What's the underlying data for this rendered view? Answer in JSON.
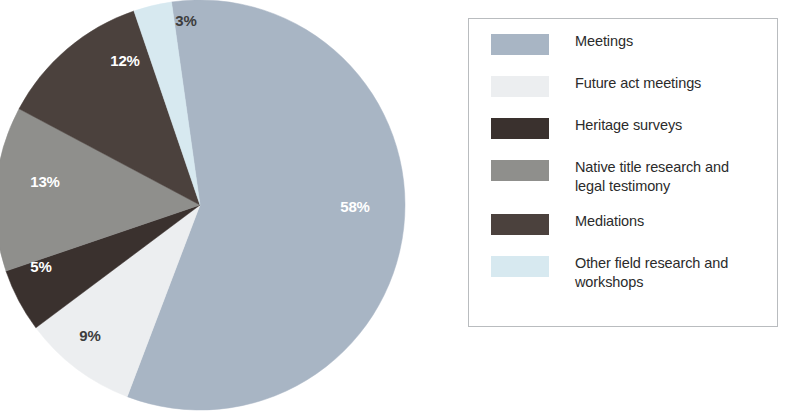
{
  "chart_data": {
    "type": "pie",
    "title": "",
    "subtitle": "",
    "xlabel": "",
    "ylabel": "",
    "grid": false,
    "legend_position": "right",
    "unit": "%",
    "start_angle_deg": -8,
    "direction": "clockwise",
    "categories": [
      "Meetings",
      "Future act meetings",
      "Heritage surveys",
      "Native title research and legal testimony",
      "Mediations",
      "Other field research and workshops"
    ],
    "values": [
      58,
      9,
      5,
      13,
      12,
      3
    ],
    "value_labels": [
      "58%",
      "9%",
      "5%",
      "13%",
      "12%",
      "3%"
    ],
    "colors": [
      "#a8b5c4",
      "#eceef0",
      "#3a312e",
      "#8f8f8c",
      "#4b413d",
      "#d7e9f0"
    ],
    "label_colors": [
      "#ffffff",
      "#3d3d3d",
      "#ffffff",
      "#ffffff",
      "#ffffff",
      "#3d3d3d"
    ],
    "slices": [
      {
        "label": "Meetings",
        "value": 58,
        "value_label": "58%",
        "color": "#a8b5c4",
        "label_color": "#ffffff",
        "label_x": 355,
        "label_y": 208
      },
      {
        "label": "Future act meetings",
        "value": 9,
        "value_label": "9%",
        "color": "#eceef0",
        "label_color": "#3d3d3d",
        "label_x": 90,
        "label_y": 337
      },
      {
        "label": "Heritage surveys",
        "value": 5,
        "value_label": "5%",
        "color": "#3a312e",
        "label_color": "#ffffff",
        "label_x": 41,
        "label_y": 268
      },
      {
        "label": "Native title research and legal testimony",
        "value": 13,
        "value_label": "13%",
        "color": "#8f8f8c",
        "label_color": "#ffffff",
        "label_x": 45,
        "label_y": 183
      },
      {
        "label": "Mediations",
        "value": 12,
        "value_label": "12%",
        "color": "#4b413d",
        "label_color": "#ffffff",
        "label_x": 125,
        "label_y": 62
      },
      {
        "label": "Other field research and workshops",
        "value": 3,
        "value_label": "3%",
        "color": "#d7e9f0",
        "label_color": "#3d3d3d",
        "label_x": 186,
        "label_y": 22
      }
    ],
    "geometry": {
      "center_x": 200,
      "center_y": 205,
      "radius": 205
    }
  },
  "legend": {
    "border_color": "#b9bcbf",
    "items": [
      {
        "label": "Meetings",
        "color": "#a8b5c4",
        "two_line": false
      },
      {
        "label": "Future act meetings",
        "color": "#eceef0",
        "two_line": false
      },
      {
        "label": "Heritage surveys",
        "color": "#3a312e",
        "two_line": false
      },
      {
        "label": "Native title research and legal testimony",
        "color": "#8f8f8c",
        "two_line": true
      },
      {
        "label": "Mediations",
        "color": "#4b413d",
        "two_line": false
      },
      {
        "label": "Other field research and workshops",
        "color": "#d7e9f0",
        "two_line": true
      }
    ]
  }
}
